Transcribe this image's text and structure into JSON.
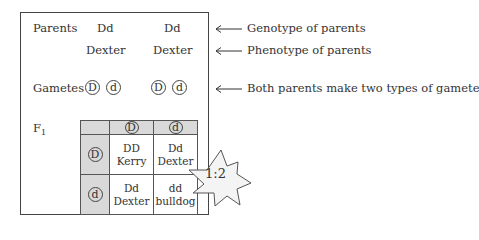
{
  "diagram": {
    "parents_label": "Parents",
    "parent1": {
      "genotype": "Dd",
      "phenotype": "Dexter"
    },
    "parent2": {
      "genotype": "Dd",
      "phenotype": "Dexter"
    },
    "gametes_label": "Gametes",
    "parent1_gametes": [
      "D",
      "d"
    ],
    "parent2_gametes": [
      "D",
      "d"
    ],
    "f1_label": "F",
    "f1_subscript": "1",
    "punnett": {
      "col_headers": [
        "D",
        "d"
      ],
      "row_headers": [
        "D",
        "d"
      ],
      "cells": [
        [
          {
            "genotype": "DD",
            "phenotype": "Kerry"
          },
          {
            "genotype": "Dd",
            "phenotype": "Dexter"
          }
        ],
        [
          {
            "genotype": "Dd",
            "phenotype": "Dexter"
          },
          {
            "genotype": "dd",
            "phenotype": "bulldog"
          }
        ]
      ]
    },
    "ratio_badge": "1:2",
    "annotations": [
      "Genotype of parents",
      "Phenotype of parents",
      "Both parents make two types of gamete"
    ]
  },
  "colors": {
    "shade": "#d9d9d9",
    "line": "#444444",
    "star_fill": "#f2f2f2"
  }
}
